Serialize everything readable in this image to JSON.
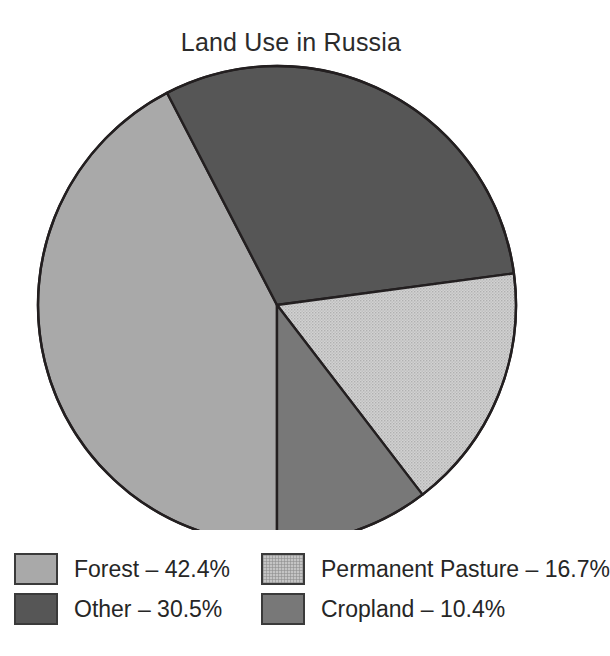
{
  "chart_data": {
    "type": "pie",
    "title": "Land Use in Russia",
    "xlabel": "",
    "ylabel": "",
    "legend_position": "bottom",
    "grid": false,
    "categories": [
      "Forest",
      "Other",
      "Permanent Pasture",
      "Cropland"
    ],
    "values": [
      42.4,
      30.5,
      16.7,
      10.4
    ],
    "units": "%",
    "slices": [
      {
        "label": "Forest",
        "value": 42.4,
        "legend_text": "Forest – 42.4%",
        "color": "#a9a9a9",
        "fill_style": "solid",
        "start_angle_deg": 180.0,
        "end_angle_deg": 332.6
      },
      {
        "label": "Other",
        "value": 30.5,
        "legend_text": "Other – 30.5%",
        "color": "#565656",
        "fill_style": "solid",
        "start_angle_deg": 332.6,
        "end_angle_deg": 442.4
      },
      {
        "label": "Permanent Pasture",
        "value": 16.7,
        "legend_text": "Permanent Pasture – 16.7%",
        "color": "#c4c4c4",
        "fill_style": "stippled",
        "start_angle_deg": 442.4,
        "end_angle_deg": 502.5
      },
      {
        "label": "Cropland",
        "value": 10.4,
        "legend_text": "Cropland – 10.4%",
        "color": "#787878",
        "fill_style": "solid",
        "start_angle_deg": 502.5,
        "end_angle_deg": 540.0
      }
    ]
  },
  "title": "Land Use in Russia",
  "legend": {
    "items": [
      {
        "label": "Forest – 42.4%",
        "color": "#a9a9a9"
      },
      {
        "label": "Permanent Pasture – 16.7%",
        "color": "#c4c4c4"
      },
      {
        "label": "Other – 30.5%",
        "color": "#565656"
      },
      {
        "label": "Cropland – 10.4%",
        "color": "#787878"
      }
    ]
  },
  "colors": {
    "forest": "#a9a9a9",
    "other": "#565656",
    "permanent_pasture": "#c4c4c4",
    "cropland": "#787878",
    "outline": "#231f20",
    "background": "#ffffff",
    "text": "#262626"
  }
}
